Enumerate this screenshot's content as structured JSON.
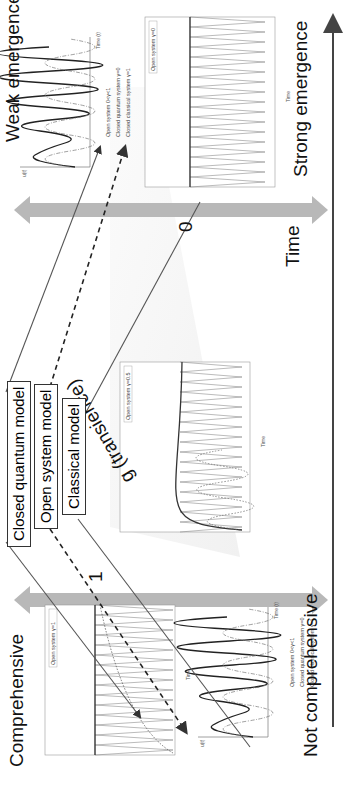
{
  "figure": {
    "orientation": "rotated-90-ccw",
    "columns": {
      "left_top": "Comprehensive",
      "left_bottom": "Not comprehensive",
      "right_top": "Weak emergence",
      "right_bottom": "Strong emergence"
    },
    "models": [
      {
        "label": "Closed quantum model",
        "line": "solid"
      },
      {
        "label": "Open system model",
        "line": "dashed"
      },
      {
        "label": "Classical model",
        "line": "solid"
      }
    ],
    "transience": {
      "label": "g (transience)",
      "start_value": "1",
      "end_value": "0"
    },
    "time_axis_label": "Time",
    "colors": {
      "background": "#ffffff",
      "arrow_gray": "#b8b8b8",
      "text": "#111111",
      "plot_line": "#555555"
    }
  },
  "plots": {
    "open_gamma1": {
      "legend": "Open system γ=1",
      "ylabel": "Probability of belief state being yes",
      "xlabel": "Time",
      "yticks": [
        "0.4",
        "0.45",
        "0.5",
        "0.55",
        "0.6",
        "0.65",
        "0.7",
        "0.75",
        "0.8",
        "0.85",
        "0.9"
      ],
      "xticks": [
        "0",
        "1",
        "2",
        "3",
        "4",
        "5",
        "6",
        "7",
        "8",
        "9",
        "10"
      ]
    },
    "open_gamma05": {
      "legend": "Open system γ=0.5",
      "ylabel": "Probability of belief state being yes",
      "xlabel": "Time",
      "yticks": [
        "0.4",
        "0.45",
        "0.5",
        "0.55",
        "0.6",
        "0.65",
        "0.7",
        "0.75",
        "0.8",
        "0.85",
        "0.9"
      ],
      "xticks": [
        "0",
        "1",
        "2",
        "3",
        "4",
        "5",
        "6",
        "7",
        "8",
        "9",
        "10"
      ]
    },
    "open_gamma0": {
      "legend": "Open system γ=0",
      "ylabel": "Probability of belief state being yes",
      "xlabel": "Time",
      "yticks": [
        "0.4",
        "0.45",
        "0.5",
        "0.55",
        "0.6",
        "0.65",
        "0.7",
        "0.75",
        "0.8",
        "0.85",
        "0.9"
      ],
      "xticks": [
        "0",
        "1",
        "2",
        "3",
        "4",
        "5",
        "6",
        "7",
        "8",
        "9",
        "10"
      ]
    },
    "schematic": {
      "ylabel": "u(t)",
      "xlabel": "Time (t)",
      "annotations": [
        "u(t)",
        "u(tₖ₊₁)",
        "tₖ",
        "tₖ₊₁"
      ],
      "legend": [
        {
          "style": "solid",
          "label": "Open system 0<γ<1"
        },
        {
          "style": "dashdot",
          "label": "Closed quantum system γ=0"
        },
        {
          "style": "dotted",
          "label": "Closed classical system γ=1"
        }
      ]
    }
  }
}
